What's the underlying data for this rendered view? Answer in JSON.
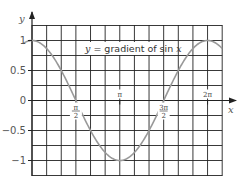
{
  "chart_data": {
    "type": "line",
    "title": "",
    "xlabel": "x",
    "ylabel": "y",
    "curve_label": {
      "prefix": "y",
      "text": " = gradient of sin ",
      "suffix": "x"
    },
    "series": [
      {
        "name": "y = gradient of sin x",
        "function": "cos(x)",
        "x": [
          -0.35,
          0,
          0.785,
          1.571,
          2.356,
          3.142,
          3.927,
          4.712,
          5.498,
          6.283,
          6.8
        ],
        "values": [
          0.94,
          1,
          0.707,
          0,
          -0.707,
          -1,
          -0.707,
          0,
          0.707,
          1,
          0.87
        ],
        "color": "#999999"
      }
    ],
    "x_ticks": [
      {
        "value": 1.5708,
        "label_num": "π",
        "label_den": "2"
      },
      {
        "value": 3.1416,
        "label": "π"
      },
      {
        "value": 4.7124,
        "label_num": "3π",
        "label_den": "2"
      },
      {
        "value": 6.2832,
        "label": "2π"
      }
    ],
    "y_ticks": [
      {
        "value": 1,
        "label": "1"
      },
      {
        "value": 0.5,
        "label": "0.5"
      },
      {
        "value": 0,
        "label": "0"
      },
      {
        "value": -0.5,
        "label": "−0.5"
      },
      {
        "value": -1,
        "label": "−1"
      }
    ],
    "xlim": [
      0,
      6.8
    ],
    "ylim": [
      -1.25,
      1.25
    ],
    "grid": true,
    "grid_color": "#222222",
    "axis_color": "#222222",
    "legend": "inline label"
  }
}
